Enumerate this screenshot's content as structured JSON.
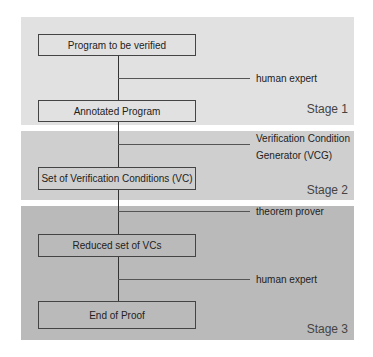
{
  "stages": [
    {
      "label": "Stage 1",
      "color": "#e1e1e1"
    },
    {
      "label": "Stage 2",
      "color": "#cfcfcf"
    },
    {
      "label": "Stage 3",
      "color": "#bababa"
    }
  ],
  "boxes": [
    {
      "label": "Program to be verified"
    },
    {
      "label": "Annotated Program"
    },
    {
      "label": "Set of Verification Conditions (VC)"
    },
    {
      "label": "Reduced set of VCs"
    },
    {
      "label": "End of Proof"
    }
  ],
  "transitions": [
    {
      "label": "human expert"
    },
    {
      "label_line1": "Verification Condition",
      "label_line2": "Generator (VCG)"
    },
    {
      "label": "theorem prover"
    },
    {
      "label": "human expert"
    }
  ]
}
